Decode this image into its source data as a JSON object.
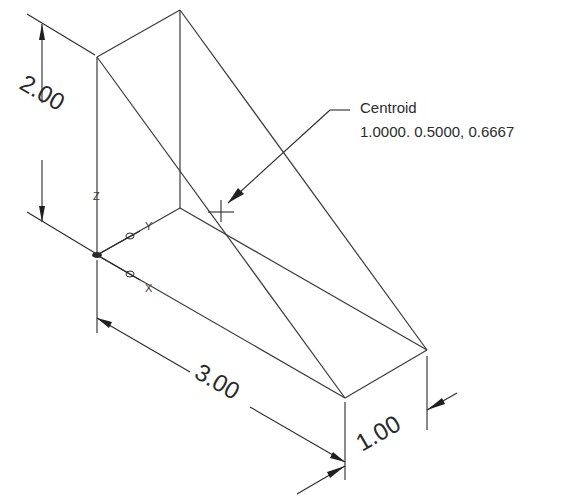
{
  "figure": {
    "type": "isometric wedge with centroid callout",
    "dimensions": {
      "height": "2.00",
      "length": "3.00",
      "width": "1.00"
    },
    "centroid": {
      "label": "Centroid",
      "coordinates": "1.0000. 0.5000, 0.6667"
    },
    "axes": {
      "x": "X",
      "y": "Y",
      "z": "Z"
    },
    "caption": ""
  }
}
